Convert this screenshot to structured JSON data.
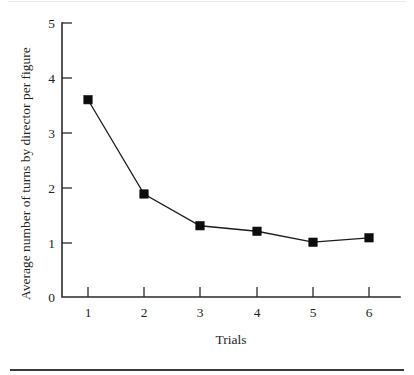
{
  "chart_data": {
    "type": "line",
    "title": "",
    "xlabel": "Trials",
    "ylabel": "Average number of turns by director per figure",
    "categories": [
      "1",
      "2",
      "3",
      "4",
      "5",
      "6"
    ],
    "x": [
      1,
      2,
      3,
      4,
      5,
      6
    ],
    "values": [
      3.6,
      1.88,
      1.3,
      1.2,
      1.0,
      1.08
    ],
    "series": [
      {
        "name": "Average number of turns by director per figure",
        "values": [
          3.6,
          1.88,
          1.3,
          1.2,
          1.0,
          1.08
        ]
      }
    ],
    "xlim": [
      0.45,
      6.55
    ],
    "ylim": [
      0,
      5
    ],
    "ytick_labels": [
      "0",
      "1",
      "2",
      "3",
      "4",
      "5"
    ],
    "yticks": [
      0,
      1,
      2,
      3,
      4,
      5
    ],
    "xtick_labels": [
      "1",
      "2",
      "3",
      "4",
      "5",
      "6"
    ],
    "xticks": [
      1,
      2,
      3,
      4,
      5,
      6
    ],
    "grid": false,
    "legend": false,
    "legend_position": "none",
    "marker": "filled-square",
    "line_color": "#1c1c1c",
    "marker_color": "#0d0d0d",
    "axis_color": "#2b2b2b",
    "background_color": "#ffffff"
  },
  "figure": {
    "bottom_rule_color": "#3a3a3a"
  }
}
